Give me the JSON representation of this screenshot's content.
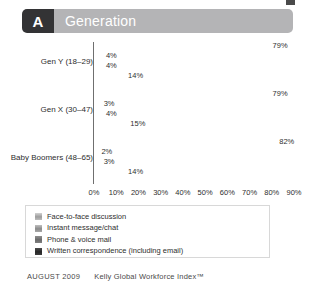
{
  "header": {
    "badge": "A",
    "title": "Generation"
  },
  "footer": {
    "date": "AUGUST 2009",
    "source": "Kelly Global Workforce Index™"
  },
  "legend": {
    "items": [
      {
        "label": "Face-to-face discussion"
      },
      {
        "label": "Instant message/chat"
      },
      {
        "label": "Phone & voice mail"
      },
      {
        "label": "Written correspondence (including email)"
      }
    ]
  },
  "chart_data": {
    "type": "bar",
    "orientation": "horizontal",
    "title": "Generation",
    "xlabel": "",
    "ylabel": "",
    "xlim": [
      0,
      90
    ],
    "grid": false,
    "legend_position": "bottom",
    "xticks": [
      "0%",
      "10%",
      "20%",
      "30%",
      "40%",
      "50%",
      "60%",
      "70%",
      "80%",
      "90%"
    ],
    "xtick_values": [
      0,
      10,
      20,
      30,
      40,
      50,
      60,
      70,
      80,
      90
    ],
    "categories": [
      "Gen Y (18–29)",
      "Gen X (30–47)",
      "Baby Boomers (48–65)"
    ],
    "series": [
      {
        "name": "Face-to-face discussion",
        "values": [
          79,
          79,
          82
        ],
        "labels": [
          "79%",
          "79%",
          "82%"
        ]
      },
      {
        "name": "Instant message/chat",
        "values": [
          4,
          3,
          2
        ],
        "labels": [
          "4%",
          "3%",
          "2%"
        ]
      },
      {
        "name": "Phone & voice mail",
        "values": [
          4,
          4,
          3
        ],
        "labels": [
          "4%",
          "4%",
          "3%"
        ]
      },
      {
        "name": "Written correspondence (including email)",
        "values": [
          14,
          15,
          14
        ],
        "labels": [
          "14%",
          "15%",
          "14%"
        ]
      }
    ],
    "colors": [
      "#a8a8a8",
      "#949494",
      "#727272",
      "#2b2b2b"
    ]
  }
}
